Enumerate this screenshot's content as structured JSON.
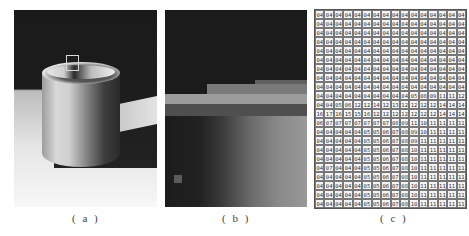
{
  "figure": {
    "panels": [
      {
        "id": "a",
        "caption": "( a )",
        "description": "grayscale photo of cylinder with highlighted region box"
      },
      {
        "id": "b",
        "caption": "( b )",
        "description": "pixel-level magnification of highlighted region"
      },
      {
        "id": "c",
        "caption": "( c )",
        "description": "numeric pixel intensity values of magnified region"
      }
    ]
  },
  "grid": {
    "columns": 16,
    "rows": [
      [
        "04",
        "04",
        "04",
        "04",
        "04",
        "04",
        "04",
        "04",
        "04",
        "04",
        "04",
        "04",
        "04",
        "04",
        "04",
        "04"
      ],
      [
        "04",
        "04",
        "04",
        "04",
        "04",
        "04",
        "04",
        "04",
        "04",
        "04",
        "04",
        "04",
        "04",
        "04",
        "04",
        "04"
      ],
      [
        "04",
        "04",
        "04",
        "04",
        "04",
        "04",
        "04",
        "04",
        "04",
        "04",
        "04",
        "04",
        "04",
        "04",
        "04",
        "04"
      ],
      [
        "04",
        "04",
        "04",
        "04",
        "04",
        "04",
        "04",
        "04",
        "04",
        "04",
        "04",
        "04",
        "04",
        "04",
        "04",
        "04"
      ],
      [
        "04",
        "04",
        "04",
        "04",
        "04",
        "04",
        "04",
        "04",
        "04",
        "04",
        "04",
        "04",
        "04",
        "04",
        "04",
        "04"
      ],
      [
        "04",
        "04",
        "04",
        "04",
        "04",
        "04",
        "04",
        "04",
        "04",
        "04",
        "04",
        "04",
        "04",
        "04",
        "04",
        "04"
      ],
      [
        "04",
        "04",
        "04",
        "04",
        "04",
        "04",
        "04",
        "04",
        "04",
        "04",
        "04",
        "04",
        "04",
        "04",
        "04",
        "04"
      ],
      [
        "04",
        "04",
        "04",
        "04",
        "04",
        "04",
        "04",
        "04",
        "04",
        "04",
        "04",
        "04",
        "04",
        "04",
        "04",
        "04"
      ],
      [
        "04",
        "04",
        "04",
        "04",
        "04",
        "04",
        "04",
        "04",
        "04",
        "04",
        "04",
        "04",
        "04",
        "04",
        "04",
        "04"
      ],
      [
        "04",
        "04",
        "04",
        "04",
        "04",
        "04",
        "04",
        "04",
        "04",
        "04",
        "05",
        "08",
        "09",
        "11",
        "11",
        "12"
      ],
      [
        "04",
        "04",
        "05",
        "06",
        "12",
        "12",
        "14",
        "12",
        "13",
        "12",
        "12",
        "12",
        "12",
        "14",
        "14",
        "14"
      ],
      [
        "16",
        "17",
        "16",
        "15",
        "15",
        "16",
        "12",
        "12",
        "12",
        "12",
        "12",
        "12",
        "12",
        "14",
        "14",
        "14"
      ],
      [
        "06",
        "07",
        "07",
        "07",
        "07",
        "07",
        "07",
        "07",
        "08",
        "09",
        "11",
        "10",
        "11",
        "11",
        "11",
        "11"
      ],
      [
        "04",
        "04",
        "04",
        "04",
        "04",
        "05",
        "05",
        "06",
        "07",
        "08",
        "09",
        "10",
        "11",
        "11",
        "11",
        "11"
      ],
      [
        "04",
        "04",
        "04",
        "04",
        "04",
        "05",
        "05",
        "06",
        "07",
        "08",
        "09",
        "11",
        "11",
        "11",
        "11",
        "11"
      ],
      [
        "04",
        "04",
        "04",
        "04",
        "04",
        "05",
        "05",
        "06",
        "07",
        "08",
        "10",
        "11",
        "11",
        "11",
        "11",
        "11"
      ],
      [
        "04",
        "04",
        "04",
        "04",
        "04",
        "05",
        "05",
        "06",
        "07",
        "08",
        "10",
        "11",
        "11",
        "11",
        "11",
        "11"
      ],
      [
        "04",
        "07",
        "04",
        "04",
        "04",
        "05",
        "05",
        "06",
        "07",
        "08",
        "10",
        "11",
        "11",
        "11",
        "11",
        "11"
      ],
      [
        "04",
        "04",
        "04",
        "04",
        "04",
        "05",
        "05",
        "06",
        "07",
        "08",
        "10",
        "11",
        "11",
        "11",
        "11",
        "11"
      ],
      [
        "04",
        "04",
        "04",
        "04",
        "04",
        "05",
        "05",
        "06",
        "07",
        "08",
        "10",
        "11",
        "11",
        "11",
        "11",
        "11"
      ],
      [
        "04",
        "04",
        "04",
        "04",
        "04",
        "05",
        "05",
        "06",
        "07",
        "08",
        "10",
        "11",
        "11",
        "11",
        "11",
        "11"
      ],
      [
        "04",
        "04",
        "04",
        "04",
        "04",
        "05",
        "05",
        "06",
        "07",
        "08",
        "10",
        "11",
        "11",
        "11",
        "11",
        "11"
      ]
    ]
  }
}
